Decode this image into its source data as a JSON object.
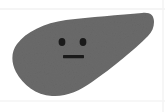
{
  "canvas": {
    "width": 165,
    "height": 112,
    "background_color": "#ffffff"
  },
  "illustration": {
    "title": "Liver character",
    "subject": "liver",
    "style": "flat cartoon silhouette with simple face",
    "body": {
      "name": "liver-body",
      "fill_color": "#6a6a6a",
      "texture": "subtle grain noise",
      "bounds": {
        "x": 11,
        "y": 12,
        "width": 143,
        "height": 85
      },
      "path": "M 154 22 C 154 15 150 12 142 13 C 120 15 90 17 66 20 C 44 23 26 32 17 44 C 11 52 11 62 16 72 C 23 85 36 95 52 96 C 66 97 79 91 92 82 C 112 68 134 50 148 36 C 152 32 154 27 154 22 Z"
    },
    "face": {
      "name": "liver-face",
      "expression": "neutral",
      "feature_color": "#1a1a1a",
      "eyes": [
        {
          "name": "left-eye",
          "cx": 62,
          "cy": 42,
          "rx": 3.4,
          "ry": 4.0
        },
        {
          "name": "right-eye",
          "cx": 83,
          "cy": 42,
          "rx": 3.4,
          "ry": 4.0
        }
      ],
      "mouth": {
        "name": "mouth",
        "shape": "straight-line",
        "x": 63,
        "y": 55,
        "width": 21,
        "height": 3.2
      }
    },
    "guides": [
      {
        "name": "guide-line-top",
        "orientation": "horizontal",
        "y": 9,
        "color": "#f2f2f2"
      },
      {
        "name": "guide-line-bottom",
        "orientation": "horizontal",
        "y": 101,
        "color": "#f4f4f4"
      },
      {
        "name": "guide-line-right",
        "orientation": "vertical",
        "x": 163,
        "color": "#f4f4f4"
      }
    ]
  }
}
